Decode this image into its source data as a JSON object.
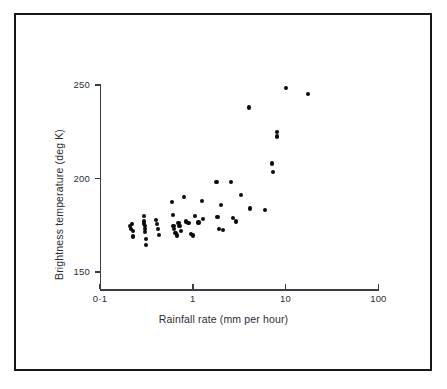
{
  "figure": {
    "background_color": "#ffffff",
    "frame_color": "#14161a",
    "axis_color": "#3a3d42",
    "marker_color": "#0a0b0d"
  },
  "chart_data": {
    "type": "scatter",
    "title": "",
    "xlabel": "Rainfall rate (mm per hour)",
    "ylabel": "Brightness temperature (deg K)",
    "xscale": "log",
    "yscale": "linear",
    "xlim": [
      0.1,
      100
    ],
    "ylim": [
      145,
      255
    ],
    "grid": false,
    "legend": null,
    "xticks": [
      0.1,
      1,
      10,
      100
    ],
    "xtick_labels": [
      "0·1",
      "1",
      "10",
      "100"
    ],
    "yticks": [
      150,
      200,
      250
    ],
    "ytick_labels": [
      "150",
      "200",
      "250"
    ],
    "series": [
      {
        "name": "observations",
        "marker": "filled-circle",
        "points": [
          [
            0.21,
            174.5
          ],
          [
            0.215,
            173.0
          ],
          [
            0.22,
            175.5
          ],
          [
            0.225,
            172.0
          ],
          [
            0.225,
            169.0
          ],
          [
            0.3,
            180.0
          ],
          [
            0.3,
            177.0
          ],
          [
            0.3,
            175.5
          ],
          [
            0.305,
            174.5
          ],
          [
            0.305,
            173.0
          ],
          [
            0.305,
            171.5
          ],
          [
            0.31,
            167.5
          ],
          [
            0.31,
            164.5
          ],
          [
            0.4,
            178.0
          ],
          [
            0.41,
            175.5
          ],
          [
            0.42,
            173.0
          ],
          [
            0.43,
            170.0
          ],
          [
            0.6,
            187.5
          ],
          [
            0.61,
            180.5
          ],
          [
            0.62,
            174.5
          ],
          [
            0.63,
            173.0
          ],
          [
            0.65,
            171.0
          ],
          [
            0.67,
            169.5
          ],
          [
            0.7,
            176.0
          ],
          [
            0.72,
            174.5
          ],
          [
            0.75,
            172.0
          ],
          [
            0.8,
            190.0
          ],
          [
            0.85,
            177.0
          ],
          [
            0.9,
            176.0
          ],
          [
            0.95,
            170.5
          ],
          [
            1.0,
            169.5
          ],
          [
            1.05,
            180.0
          ],
          [
            1.15,
            176.5
          ],
          [
            1.25,
            188.0
          ],
          [
            1.3,
            178.5
          ],
          [
            1.8,
            198.0
          ],
          [
            1.85,
            179.5
          ],
          [
            1.9,
            173.0
          ],
          [
            2.0,
            186.0
          ],
          [
            2.1,
            172.5
          ],
          [
            2.6,
            198.0
          ],
          [
            2.7,
            179.0
          ],
          [
            2.9,
            177.0
          ],
          [
            3.3,
            191.0
          ],
          [
            4.0,
            238.0
          ],
          [
            4.1,
            184.0
          ],
          [
            6.0,
            183.0
          ],
          [
            7.2,
            208.0
          ],
          [
            7.3,
            203.5
          ],
          [
            8.0,
            225.0
          ],
          [
            8.1,
            222.5
          ],
          [
            10.0,
            248.5
          ],
          [
            17.5,
            245.0
          ]
        ]
      }
    ]
  },
  "axes_geometry": {
    "x_pixel_of_0_1": 100,
    "x_pixels_per_decade": 92.8,
    "y_pixel_of_150": 272,
    "y_pixel_of_250": 85
  }
}
